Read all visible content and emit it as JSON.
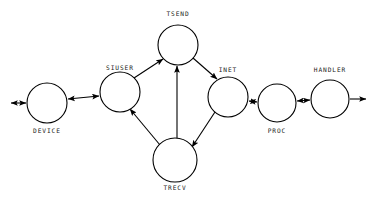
{
  "diagram": {
    "type": "node-link-graph",
    "background_color": "#ffffff",
    "stroke_color": "#000000",
    "label_color": "#1a1a1a",
    "nodes": [
      {
        "id": "device",
        "label": "DEVICE",
        "cx": 47,
        "cy": 103,
        "r": 20,
        "label_x": 47,
        "label_y": 131
      },
      {
        "id": "siuser",
        "label": "SIUSER",
        "cx": 120,
        "cy": 92,
        "r": 20,
        "label_x": 120,
        "label_y": 68
      },
      {
        "id": "tsend",
        "label": "TSEND",
        "cx": 178,
        "cy": 45,
        "r": 20,
        "label_x": 178,
        "label_y": 14
      },
      {
        "id": "inet",
        "label": "INET",
        "cx": 228,
        "cy": 97,
        "r": 20,
        "label_x": 228,
        "label_y": 70
      },
      {
        "id": "proc",
        "label": "PROC",
        "cx": 277,
        "cy": 103,
        "r": 19,
        "label_x": 277,
        "label_y": 131
      },
      {
        "id": "handler",
        "label": "HANDLER",
        "cx": 330,
        "cy": 99,
        "r": 19,
        "label_x": 330,
        "label_y": 70
      },
      {
        "id": "trecv",
        "label": "TRECV",
        "cx": 175,
        "cy": 160,
        "r": 22,
        "label_x": 175,
        "label_y": 188
      }
    ],
    "edges": [
      {
        "id": "edge-external-device",
        "from": "external-left",
        "to": "device",
        "direction": "bidirectional"
      },
      {
        "id": "edge-device-siuser",
        "from": "device",
        "to": "siuser",
        "direction": "bidirectional"
      },
      {
        "id": "edge-siuser-tsend",
        "from": "siuser",
        "to": "tsend",
        "direction": "forward"
      },
      {
        "id": "edge-trecv-tsend",
        "from": "trecv",
        "to": "tsend",
        "direction": "forward"
      },
      {
        "id": "edge-tsend-inet",
        "from": "tsend",
        "to": "inet",
        "direction": "forward"
      },
      {
        "id": "edge-inet-trecv",
        "from": "inet",
        "to": "trecv",
        "direction": "forward"
      },
      {
        "id": "edge-trecv-siuser",
        "from": "trecv",
        "to": "siuser",
        "direction": "forward"
      },
      {
        "id": "edge-inet-proc",
        "from": "inet",
        "to": "proc",
        "direction": "bidirectional"
      },
      {
        "id": "edge-proc-handler",
        "from": "proc",
        "to": "handler",
        "direction": "bidirectional"
      },
      {
        "id": "edge-handler-external",
        "from": "handler",
        "to": "external-right",
        "direction": "forward"
      }
    ]
  }
}
